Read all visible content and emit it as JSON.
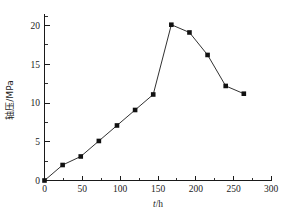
{
  "chart_data": {
    "type": "line",
    "title": "",
    "xlabel": "t/h",
    "ylabel": "轴压/MPa",
    "xlim": [
      0,
      300
    ],
    "ylim": [
      0,
      22
    ],
    "xticks": [
      0,
      50,
      100,
      150,
      200,
      250,
      300
    ],
    "xtick_labels": [
      "0",
      "50",
      "100",
      "150",
      "200",
      "250",
      "300"
    ],
    "yticks": [
      0,
      5,
      10,
      15,
      20
    ],
    "ytick_labels": [
      "0",
      "5",
      "10",
      "15",
      "20"
    ],
    "x_minor_interval": 25,
    "y_minor_interval": 2.5,
    "grid": false,
    "legend": null,
    "marker": "square",
    "marker_color": "#111111",
    "line_color": "#1a1a1a",
    "x": [
      0,
      24,
      48,
      72,
      96,
      120,
      144,
      168,
      192,
      216,
      240,
      264
    ],
    "values": [
      0,
      2.0,
      3.1,
      5.1,
      7.1,
      9.1,
      11.1,
      20.1,
      19.1,
      16.2,
      12.2,
      11.2
    ],
    "series": [
      {
        "name": "轴压",
        "x": [
          0,
          24,
          48,
          72,
          96,
          120,
          144,
          168,
          192,
          216,
          240,
          264
        ],
        "values": [
          0,
          2.0,
          3.1,
          5.1,
          7.1,
          9.1,
          11.1,
          20.1,
          19.1,
          16.2,
          12.2,
          11.2
        ]
      }
    ]
  },
  "axes": {
    "x_title_italic": "t",
    "x_title_rest": "/h",
    "y_title": "轴压/MPa"
  }
}
